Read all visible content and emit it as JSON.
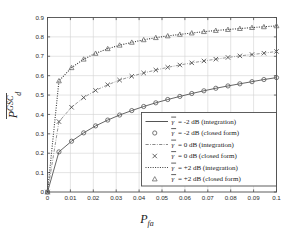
{
  "chart_data": {
    "type": "line",
    "title": "",
    "xlabel": "P_fa",
    "xlabel_main": "P",
    "xlabel_sub": "fa",
    "ylabel": "P_d^GSC (overline)",
    "ylabel_main": "P",
    "ylabel_sub": "d",
    "ylabel_sup": "GSC",
    "xlim": [
      0,
      0.1
    ],
    "ylim": [
      0,
      0.9
    ],
    "grid": true,
    "legend_position": "lower right",
    "xticks": [
      0,
      0.01,
      0.02,
      0.03,
      0.04,
      0.05,
      0.06,
      0.07,
      0.08,
      0.09,
      0.1
    ],
    "xtick_labels": [
      "0",
      "0.01",
      "0.02",
      "0.03",
      "0.04",
      "0.05",
      "0.06",
      "0.07",
      "0.08",
      "0.09",
      "0.1"
    ],
    "yticks": [
      0,
      0.1,
      0.2,
      0.3,
      0.4,
      0.5,
      0.6,
      0.7,
      0.8,
      0.9
    ],
    "ytick_labels": [
      "0",
      "0.1",
      "0.2",
      "0.3",
      "0.4",
      "0.5",
      "0.6",
      "0.7",
      "0.8",
      "0.9"
    ],
    "x": [
      0,
      0.005,
      0.0105,
      0.0158,
      0.021,
      0.0263,
      0.0315,
      0.0368,
      0.042,
      0.0473,
      0.0525,
      0.0578,
      0.063,
      0.0683,
      0.0735,
      0.0788,
      0.084,
      0.0893,
      0.0945,
      0.1
    ],
    "series": [
      {
        "name": "gamma = -2 dB (integration)",
        "label_main": "= -2 dB (integration)",
        "style": "solid",
        "marker": "none",
        "color": "#555555",
        "values": [
          0,
          0.207,
          0.262,
          0.305,
          0.341,
          0.371,
          0.397,
          0.42,
          0.441,
          0.46,
          0.477,
          0.493,
          0.508,
          0.522,
          0.535,
          0.547,
          0.558,
          0.569,
          0.58,
          0.59
        ]
      },
      {
        "name": "gamma = -2 dB (closed form)",
        "label_main": "= -2 dB (closed form)",
        "style": "none",
        "marker": "circle",
        "color": "#555555",
        "values": [
          0,
          0.207,
          0.262,
          0.305,
          0.341,
          0.371,
          0.397,
          0.42,
          0.441,
          0.46,
          0.477,
          0.493,
          0.508,
          0.522,
          0.535,
          0.547,
          0.558,
          0.569,
          0.58,
          0.59
        ]
      },
      {
        "name": "gamma = 0 dB (integration)",
        "label_main": "= 0 dB (integration)",
        "style": "dashdot",
        "marker": "none",
        "color": "#8a8a8a",
        "values": [
          0,
          0.363,
          0.437,
          0.487,
          0.524,
          0.553,
          0.577,
          0.597,
          0.614,
          0.629,
          0.643,
          0.655,
          0.666,
          0.676,
          0.685,
          0.694,
          0.702,
          0.709,
          0.716,
          0.725
        ]
      },
      {
        "name": "gamma = 0 dB (closed form)",
        "label_main": "= 0 dB (closed form)",
        "style": "none",
        "marker": "cross",
        "color": "#4a4a4a",
        "values": [
          0,
          0.363,
          0.437,
          0.487,
          0.524,
          0.553,
          0.577,
          0.597,
          0.614,
          0.629,
          0.643,
          0.655,
          0.666,
          0.676,
          0.685,
          0.694,
          0.702,
          0.709,
          0.716,
          0.725
        ]
      },
      {
        "name": "gamma = +2 dB (integration)",
        "label_main": "= +2 dB (integration)",
        "style": "dotted",
        "marker": "none",
        "color": "#3a3a3a",
        "values": [
          0,
          0.573,
          0.641,
          0.685,
          0.715,
          0.739,
          0.757,
          0.772,
          0.785,
          0.796,
          0.805,
          0.813,
          0.82,
          0.827,
          0.833,
          0.838,
          0.843,
          0.848,
          0.852,
          0.857
        ]
      },
      {
        "name": "gamma = +2 dB (closed form)",
        "label_main": "= +2 dB (closed form)",
        "style": "none",
        "marker": "triangle",
        "color": "#6a6a6a",
        "values": [
          0,
          0.573,
          0.641,
          0.685,
          0.715,
          0.739,
          0.757,
          0.772,
          0.785,
          0.796,
          0.805,
          0.813,
          0.82,
          0.827,
          0.833,
          0.838,
          0.843,
          0.848,
          0.852,
          0.857
        ]
      }
    ]
  },
  "legend": {
    "gamma_symbol": "γ",
    "entries": [
      {
        "symbol_kind": "line-solid",
        "text": "= -2 dB (integration)"
      },
      {
        "symbol_kind": "marker-circle",
        "text": "= -2 dB (closed form)"
      },
      {
        "symbol_kind": "line-dashdot",
        "text": "= 0 dB (integration)"
      },
      {
        "symbol_kind": "marker-cross",
        "text": "= 0 dB (closed form)"
      },
      {
        "symbol_kind": "line-dotted",
        "text": "= +2 dB (integration)"
      },
      {
        "symbol_kind": "marker-triangle",
        "text": "= +2 dB (closed form)"
      }
    ]
  },
  "style": {
    "axis_color": "#4d4d4d",
    "grid_color": "#d2d2d2",
    "background": "#ffffff",
    "text_color": "#1a1a1a"
  }
}
